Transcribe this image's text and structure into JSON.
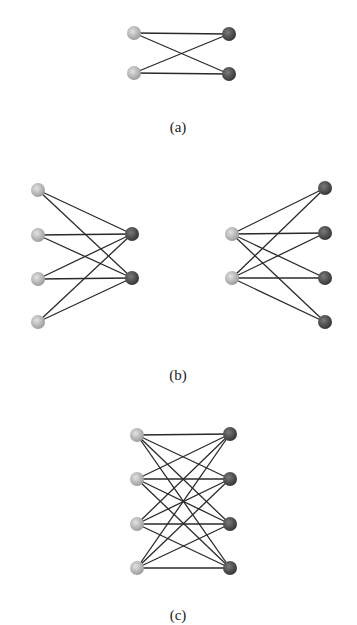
{
  "colors": {
    "background": "#ffffff",
    "edge": "#2a2a2a",
    "left_node_light": "#d8d8d8",
    "left_node_dark": "#9a9a9a",
    "right_node_light": "#7a7a7a",
    "right_node_dark": "#3e3e3e"
  },
  "node_radius": 7,
  "panels": [
    {
      "id": "a",
      "caption": "(a)",
      "caption_pos": [
        178,
        132
      ],
      "graphs": [
        {
          "name": "K2,2",
          "left": [
            [
              134,
              33
            ],
            [
              134,
              73
            ]
          ],
          "right": [
            [
              229,
              34
            ],
            [
              229,
              74
            ]
          ],
          "edges": "complete"
        }
      ]
    },
    {
      "id": "b",
      "caption": "(b)",
      "caption_pos": [
        178,
        380
      ],
      "graphs": [
        {
          "name": "K4,2",
          "left": [
            [
              38,
              190
            ],
            [
              38,
              235
            ],
            [
              38,
              279
            ],
            [
              38,
              322
            ]
          ],
          "right": [
            [
              132,
              234
            ],
            [
              132,
              278
            ]
          ],
          "edges": "complete"
        },
        {
          "name": "K2,4",
          "left": [
            [
              232,
              234
            ],
            [
              232,
              278
            ]
          ],
          "right": [
            [
              325,
              188
            ],
            [
              325,
              233
            ],
            [
              325,
              278
            ],
            [
              325,
              322
            ]
          ],
          "edges": "complete"
        }
      ]
    },
    {
      "id": "c",
      "caption": "(c)",
      "caption_pos": [
        178,
        620
      ],
      "graphs": [
        {
          "name": "K4,4",
          "left": [
            [
              137,
              435
            ],
            [
              137,
              479
            ],
            [
              137,
              524
            ],
            [
              137,
              568
            ]
          ],
          "right": [
            [
              230,
              434
            ],
            [
              230,
              479
            ],
            [
              230,
              524
            ],
            [
              230,
              568
            ]
          ],
          "edges": "complete"
        }
      ]
    }
  ]
}
